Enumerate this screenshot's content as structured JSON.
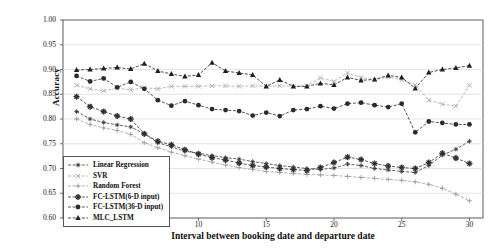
{
  "chart_data": {
    "type": "line",
    "title": "",
    "xlabel": "Interval between booking date and departure date",
    "ylabel": "Accuracy",
    "xlim": [
      0,
      31
    ],
    "ylim": [
      0.6,
      1.0
    ],
    "grid": true,
    "legend_position": "lower-left",
    "xticks": [
      5,
      10,
      15,
      20,
      25,
      30
    ],
    "yticks": [
      "1.00",
      "0.95",
      "0.90",
      "0.85",
      "0.80",
      "0.75",
      "0.70",
      "0.65",
      "0.60"
    ],
    "x": [
      1,
      2,
      3,
      4,
      5,
      6,
      7,
      8,
      9,
      10,
      11,
      12,
      13,
      14,
      15,
      16,
      17,
      18,
      19,
      20,
      21,
      22,
      23,
      24,
      25,
      26,
      27,
      28,
      29,
      30
    ],
    "series": [
      {
        "name": "Linear Regression",
        "marker": "star",
        "color": "#3a3a3a",
        "values": [
          0.815,
          0.8,
          0.793,
          0.788,
          0.784,
          0.77,
          0.752,
          0.744,
          0.735,
          0.731,
          0.726,
          0.722,
          0.719,
          0.714,
          0.71,
          0.706,
          0.703,
          0.7,
          0.698,
          0.701,
          0.709,
          0.706,
          0.7,
          0.697,
          0.694,
          0.692,
          0.706,
          0.727,
          0.739,
          0.755
        ]
      },
      {
        "name": "SVR",
        "marker": "x",
        "color": "#a8a8a8",
        "values": [
          0.868,
          0.861,
          0.857,
          0.862,
          0.859,
          0.863,
          0.861,
          0.866,
          0.866,
          0.866,
          0.867,
          0.867,
          0.866,
          0.867,
          0.866,
          0.867,
          0.866,
          0.867,
          0.883,
          0.876,
          0.893,
          0.884,
          0.879,
          0.885,
          0.879,
          0.869,
          0.838,
          0.83,
          0.826,
          0.868
        ]
      },
      {
        "name": "Random Forest",
        "marker": "plus",
        "color": "#9a9a9a",
        "values": [
          0.8,
          0.789,
          0.782,
          0.777,
          0.769,
          0.752,
          0.742,
          0.733,
          0.726,
          0.719,
          0.713,
          0.707,
          0.702,
          0.698,
          0.694,
          0.692,
          0.69,
          0.688,
          0.687,
          0.686,
          0.684,
          0.682,
          0.68,
          0.678,
          0.676,
          0.673,
          0.668,
          0.66,
          0.648,
          0.635
        ]
      },
      {
        "name": "FC-LSTM(6-D input)",
        "marker": "star-bold",
        "color": "#2f2f2f",
        "values": [
          0.845,
          0.825,
          0.815,
          0.806,
          0.8,
          0.77,
          0.755,
          0.748,
          0.738,
          0.729,
          0.722,
          0.717,
          0.711,
          0.706,
          0.703,
          0.7,
          0.698,
          0.696,
          0.702,
          0.712,
          0.723,
          0.718,
          0.71,
          0.705,
          0.702,
          0.7,
          0.712,
          0.731,
          0.721,
          0.71
        ]
      },
      {
        "name": "FC-LSTM(36-D input)",
        "marker": "circle",
        "color": "#2b2b2b",
        "values": [
          0.887,
          0.876,
          0.882,
          0.864,
          0.875,
          0.861,
          0.838,
          0.827,
          0.836,
          0.828,
          0.82,
          0.818,
          0.816,
          0.807,
          0.813,
          0.806,
          0.818,
          0.82,
          0.826,
          0.821,
          0.831,
          0.833,
          0.828,
          0.824,
          0.831,
          0.773,
          0.795,
          0.792,
          0.789,
          0.789
        ]
      },
      {
        "name": "MLC_LSTM",
        "marker": "triangle",
        "color": "#1f1f1f",
        "values": [
          0.899,
          0.9,
          0.902,
          0.904,
          0.901,
          0.912,
          0.897,
          0.891,
          0.886,
          0.889,
          0.914,
          0.897,
          0.893,
          0.889,
          0.866,
          0.879,
          0.866,
          0.866,
          0.872,
          0.869,
          0.884,
          0.878,
          0.88,
          0.888,
          0.884,
          0.862,
          0.894,
          0.9,
          0.903,
          0.908
        ]
      }
    ]
  }
}
